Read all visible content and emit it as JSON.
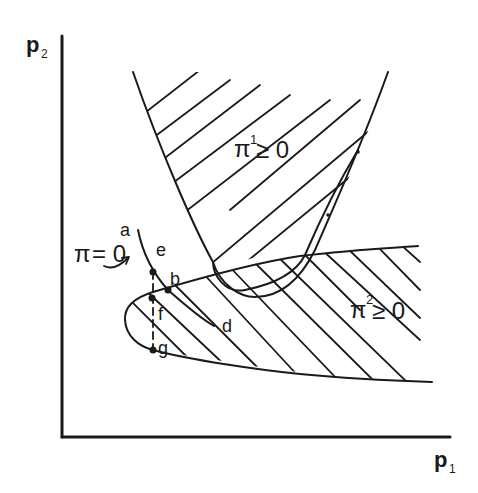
{
  "diagram": {
    "axes": {
      "x_label": "p",
      "x_sub": "1",
      "y_label": "p",
      "y_sub": "2"
    },
    "regions": {
      "pi1": {
        "symbol": "π",
        "sup": "1",
        "relation": "≥ 0"
      },
      "pi2": {
        "symbol": "π",
        "sup": "2",
        "relation": "≥ 0"
      }
    },
    "curve_label": {
      "symbol": "π",
      "relation": "= 0"
    },
    "points": {
      "a": "a",
      "b": "b",
      "d": "d",
      "e": "e",
      "f": "f",
      "g": "g"
    },
    "colors": {
      "ink": "#1a1a1a",
      "background": "#ffffff"
    }
  }
}
